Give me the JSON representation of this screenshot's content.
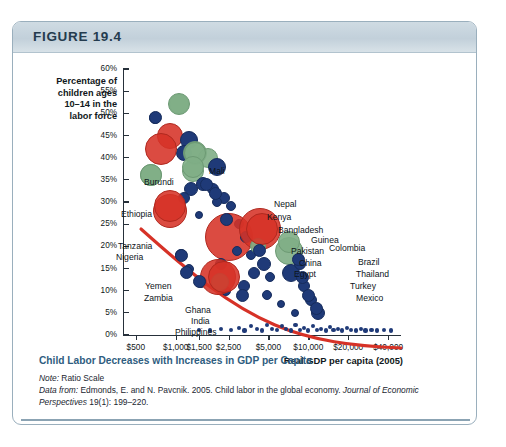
{
  "figure": {
    "number_label": "FIGURE 19.4",
    "header_color": "#c2d0da",
    "border_color": "#9aafbd"
  },
  "caption": {
    "title": "Child Labor Decreases with Increases in GDP per Capita",
    "note_prefix": "Note:",
    "note_text": " Ratio Scale",
    "source_prefix": "Data from:",
    "source_text": " Edmonds, E. and N. Pavcnik. 2005. Child labor in the global economy. ",
    "source_journal": "Journal of Economic Perspectives",
    "source_tail": " 19(1): 199–220.",
    "title_color": "#2f5d80",
    "rule_color": "#8ba3b3"
  },
  "chart_data": {
    "type": "scatter",
    "title": "Child Labor Decreases with Increases in GDP per Capita",
    "xlabel": "Real GDP per capita (2005)",
    "ylabel": "Percentage of children ages 10–14 in the labor force",
    "ylabel_lines": [
      "Percentage of",
      "children ages",
      "10–14 in the",
      "labor force"
    ],
    "x_scale": "log",
    "y_scale": "linear",
    "grid": false,
    "legend": "none",
    "xticks": [
      500,
      1000,
      1500,
      2500,
      5000,
      10000,
      20000,
      40000
    ],
    "xticklabels": [
      "$500",
      "$1,000",
      "$1,500",
      "$2,500",
      "$5,000",
      "$10,000",
      "$20,000",
      "$40,000"
    ],
    "yticks": [
      0,
      5,
      10,
      15,
      20,
      25,
      30,
      35,
      40,
      45,
      50,
      55,
      60
    ],
    "yticklabels": [
      "0%",
      "5%",
      "10%",
      "15%",
      "20%",
      "25%",
      "30%",
      "35%",
      "40%",
      "45%",
      "50%",
      "55%",
      "60%"
    ],
    "ylim": [
      0,
      60
    ],
    "xlim": [
      400,
      50000
    ],
    "series_colors": {
      "red": "#d63227",
      "green": "#7fae86",
      "navy": "#1f3a78"
    },
    "trendline": {
      "color": "#d63227",
      "description": "downward-sloping fitted curve from upper-left to lower-right"
    },
    "labeled_points": [
      {
        "name": "Burundi",
        "gdp": 700,
        "rate": 49,
        "color": "navy"
      },
      {
        "name": "Mali",
        "gdp": 1050,
        "rate": 52,
        "color": "green"
      },
      {
        "name": "Ethiopia",
        "gdp": 780,
        "rate": 42,
        "color": "red"
      },
      {
        "name": "Nepal",
        "gdp": 1400,
        "rate": 41,
        "color": "green"
      },
      {
        "name": "Kenya",
        "gdp": 1350,
        "rate": 38,
        "color": "green"
      },
      {
        "name": "Tanzania",
        "gdp": 650,
        "rate": 36,
        "color": "green"
      },
      {
        "name": "Bangladesh",
        "gdp": 1700,
        "rate": 34,
        "color": "navy"
      },
      {
        "name": "Guinea",
        "gdp": 2000,
        "rate": 32,
        "color": "navy"
      },
      {
        "name": "Nigeria",
        "gdp": 900,
        "rate": 29,
        "color": "red"
      },
      {
        "name": "Pakistan",
        "gdp": 2400,
        "rate": 26,
        "color": "navy"
      },
      {
        "name": "China",
        "gdp": 4500,
        "rate": 24,
        "color": "red"
      },
      {
        "name": "Colombia",
        "gdp": 7200,
        "rate": 21,
        "color": "green"
      },
      {
        "name": "Egypt",
        "gdp": 4300,
        "rate": 19,
        "color": "navy"
      },
      {
        "name": "Brazil",
        "gdp": 8500,
        "rate": 17,
        "color": "navy"
      },
      {
        "name": "Yemen",
        "gdp": 1100,
        "rate": 18,
        "color": "navy"
      },
      {
        "name": "Thailand",
        "gdp": 9000,
        "rate": 13,
        "color": "navy"
      },
      {
        "name": "Zambia",
        "gdp": 1200,
        "rate": 14,
        "color": "navy"
      },
      {
        "name": "Turkey",
        "gdp": 10000,
        "rate": 9,
        "color": "navy"
      },
      {
        "name": "Ghana",
        "gdp": 1500,
        "rate": 12,
        "color": "navy"
      },
      {
        "name": "Mexico",
        "gdp": 11500,
        "rate": 6,
        "color": "navy"
      },
      {
        "name": "India",
        "gdp": 2300,
        "rate": 13,
        "color": "red"
      },
      {
        "name": "Philippines",
        "gdp": 3200,
        "rate": 9,
        "color": "navy"
      }
    ]
  }
}
